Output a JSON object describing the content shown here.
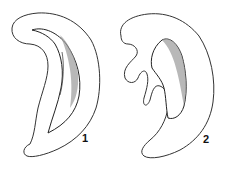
{
  "figure": {
    "panels": [
      {
        "id": "panel-1",
        "label": "1"
      },
      {
        "id": "panel-2",
        "label": "2"
      }
    ],
    "colors": {
      "line": "#333333",
      "shading": "#9a9a9a",
      "background": "#ffffff"
    }
  }
}
